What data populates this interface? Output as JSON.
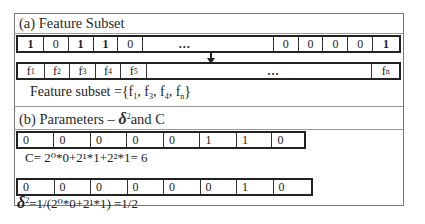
{
  "section_a": {
    "heading": "(a) Feature Subset",
    "bits": [
      "1",
      "0",
      "1",
      "1",
      "0",
      "…",
      "0",
      "0",
      "0",
      "0",
      "1"
    ],
    "features": [
      "f1",
      "f2",
      "f3",
      "f4",
      "f5",
      "…",
      "fn"
    ],
    "feature_subset_label": "Feature subset ={",
    "feature_subset_items": [
      "f1",
      "f3",
      "f4",
      "fn"
    ],
    "feature_subset_close": "}"
  },
  "section_b": {
    "heading_prefix": "(b) Parameters – ",
    "heading_delta": "δ",
    "heading_suffix": "and C",
    "c_bits": [
      "0",
      "0",
      "0",
      "0",
      "0",
      "1",
      "1",
      "0"
    ],
    "c_formula": "C= 2⁰*0+2¹*1+2²*1= 6",
    "delta_bits": [
      "0",
      "0",
      "0",
      "0",
      "0",
      "0",
      "1",
      "0"
    ],
    "delta_formula": "=1/(2⁰*0+2¹*1) =1/2"
  }
}
